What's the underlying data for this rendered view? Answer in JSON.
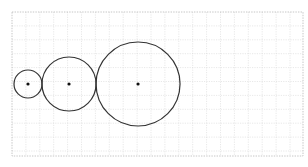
{
  "diagram": {
    "title": "",
    "grid": {
      "visible": true,
      "style": "dotted",
      "color": "#d9d9d9"
    },
    "circles": [
      {
        "id": "small",
        "relative_radius": 1.0,
        "center_marked": true
      },
      {
        "id": "medium",
        "relative_radius": 1.93,
        "center_marked": true
      },
      {
        "id": "large",
        "relative_radius": 3.0,
        "center_marked": true
      }
    ],
    "arrangement": "three circles tangent in a row, centers collinear",
    "stroke_color": "#333333",
    "dot_color": "#111111"
  }
}
